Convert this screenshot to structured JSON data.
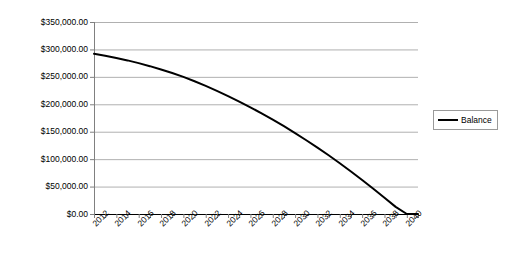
{
  "chart_data": {
    "type": "line",
    "title": "",
    "xlabel": "",
    "ylabel": "",
    "ylim": [
      0,
      350000
    ],
    "y_ticks": [
      0,
      50000,
      100000,
      150000,
      200000,
      250000,
      300000,
      350000
    ],
    "y_tick_labels": [
      "$0.00",
      "$50,000.00",
      "$100,000.00",
      "$150,000.00",
      "$200,000.00",
      "$250,000.00",
      "$300,000.00",
      "$350,000.00"
    ],
    "x_tick_labels": [
      "2012",
      "2014",
      "2016",
      "2018",
      "2020",
      "2022",
      "2024",
      "2026",
      "2028",
      "2030",
      "2032",
      "2034",
      "2036",
      "2038",
      "2040"
    ],
    "x_tick_label_step": 2,
    "grid": true,
    "grid_axis": "y",
    "grid_color": "#b0b0b0",
    "legend_position": "right",
    "legend": [
      "Balance"
    ],
    "series": [
      {
        "name": "Balance",
        "color": "#000000",
        "line_width": 2,
        "x": [
          2012,
          2013,
          2014,
          2015,
          2016,
          2017,
          2018,
          2019,
          2020,
          2021,
          2022,
          2023,
          2024,
          2025,
          2026,
          2027,
          2028,
          2029,
          2030,
          2031,
          2032,
          2033,
          2034,
          2035,
          2036,
          2037,
          2038,
          2039,
          2040,
          2041
        ],
        "values": [
          292000,
          288500,
          284500,
          280000,
          275000,
          269500,
          263500,
          257000,
          250000,
          242000,
          233500,
          224500,
          215000,
          205000,
          194500,
          183500,
          172000,
          160000,
          147500,
          134500,
          121000,
          107000,
          92500,
          77500,
          62000,
          46000,
          29500,
          13000,
          0,
          0
        ]
      }
    ]
  },
  "legend": {
    "entries": [
      {
        "label": "Balance",
        "swatch_color": "#000000"
      }
    ]
  }
}
